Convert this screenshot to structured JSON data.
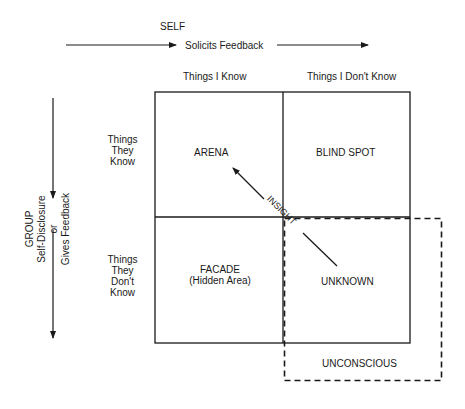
{
  "diagram": {
    "title_top": "SELF",
    "top_arrow_label": "Solicits Feedback",
    "left_axis": {
      "line1": "GROUP",
      "line2": "Self-Disclosure",
      "line3": "or",
      "line4": "Gives Feedback"
    },
    "columns": [
      "Things I Know",
      "Things I Don't Know"
    ],
    "rows": [
      {
        "line1": "Things",
        "line2": "They",
        "line3": "Know"
      },
      {
        "line1": "Things",
        "line2": "They",
        "line3": "Don't",
        "line4": "Know"
      }
    ],
    "quadrants": {
      "arena": "ARENA",
      "blind_spot": "BLIND SPOT",
      "facade": "FACADE",
      "facade_sub": "(Hidden Area)",
      "unknown": "UNKNOWN"
    },
    "insight_label": "INSIGHT",
    "unconscious_label": "UNCONSCIOUS"
  }
}
